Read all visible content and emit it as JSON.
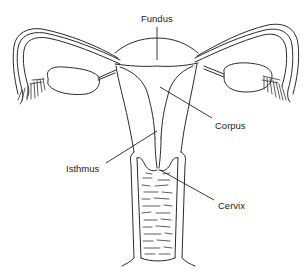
{
  "diagram": {
    "labels": {
      "fundus": "Fundus",
      "corpus": "Corpus",
      "isthmus": "Isthmus",
      "cervix": "Cervix"
    },
    "colors": {
      "line": "#2a2a2a",
      "background": "#ffffff",
      "text": "#222222"
    }
  }
}
